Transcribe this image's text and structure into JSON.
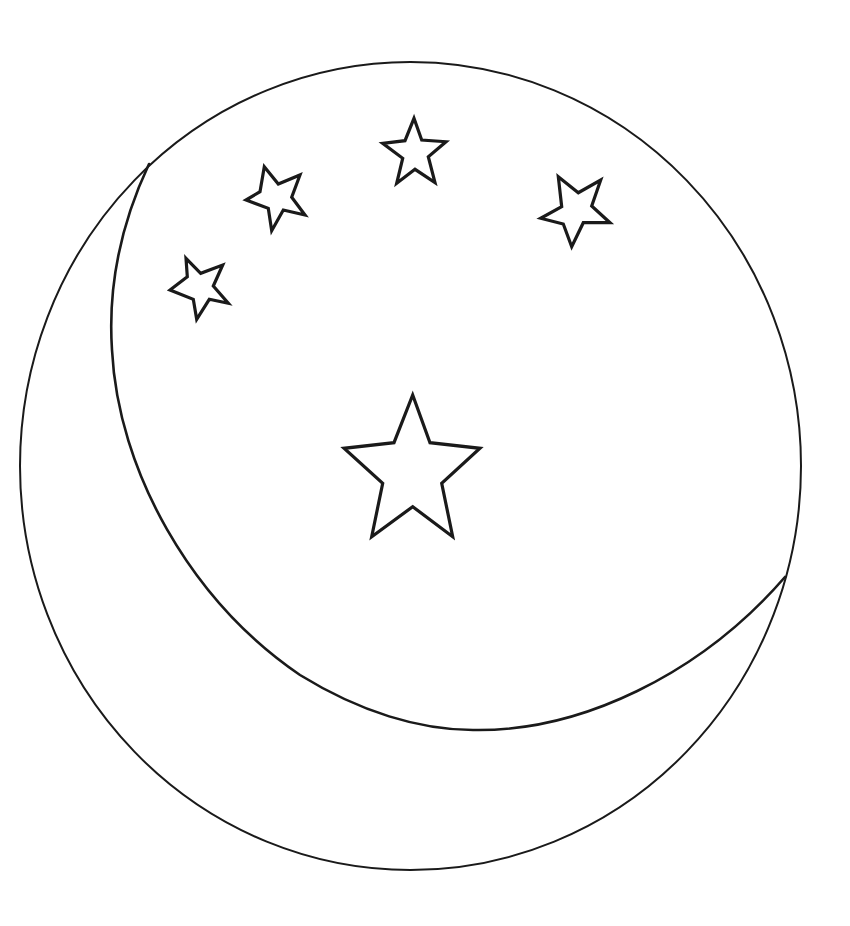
{
  "colors": {
    "background": "#ffffff",
    "line": "#1a1a1a"
  },
  "moon": {
    "outer_circle": {
      "cx": 410.5,
      "cy": 466,
      "rx": 390.5,
      "ry": 404,
      "stroke_width": 2
    },
    "crescent_arc": {
      "d": "M 149 164 C 118 230 108 290 112 350 C 118 470 190 600 300 675 C 360 712 420 730 473 730 C 580 732 700 675 785 577",
      "stroke_width": 2.6
    }
  },
  "stars": [
    {
      "name": "star-large-center",
      "points": "412.7,395 430,442.7 480,448.3 441.7,483.3 452.7,536.7 412.7,506.7 371.7,536.7 382.7,483.3 344,448.3 394,442.7"
    },
    {
      "name": "star-top",
      "points": "414,118.3 421.7,140 446,141.7 428.3,156.7 435,182.7 415,169.3 396.7,183.3 402.7,158.3 382.7,143.3 405,140.7"
    },
    {
      "name": "star-right",
      "points": "558.3,176.7 578.3,192.7 600.7,180 591.7,206 610,222.7 583.3,222.7 571.7,246.7 563.3,224 540.7,218.3 561.7,206.7"
    },
    {
      "name": "star-upper-left",
      "points": "264.3,166.7 278.3,184 300,175 291.7,197.3 305,215 283.3,210 271.7,230.7 268.3,208.3 246,200 260,191.7"
    },
    {
      "name": "star-left",
      "points": "186,258.3 200.7,273.3 222.7,265 213.3,286 228.3,303.3 209.3,299.3 196.7,319.3 193.3,299.3 170,290 187.3,276.7"
    }
  ]
}
